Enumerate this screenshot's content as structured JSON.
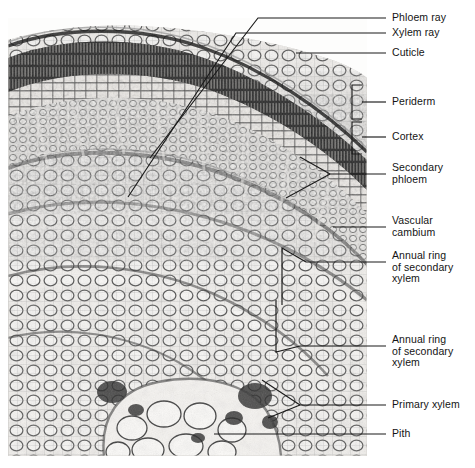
{
  "figure": {
    "kind": "light-micrograph",
    "colors": {
      "background": "#ffffff",
      "leader_line": "#1a1a1a",
      "label_text": "#141414",
      "tissue_light": "#f2f0ee",
      "tissue_mid": "#8d8d8d",
      "tissue_dark": "#1c1c1c"
    }
  },
  "labels": [
    {
      "id": "phloem-ray",
      "text": "Phloem ray"
    },
    {
      "id": "xylem-ray",
      "text": "Xylem ray"
    },
    {
      "id": "cuticle",
      "text": "Cuticle"
    },
    {
      "id": "periderm",
      "text": "Periderm"
    },
    {
      "id": "cortex",
      "text": "Cortex"
    },
    {
      "id": "secondary-phloem",
      "text": "Secondary\nphloem"
    },
    {
      "id": "vascular-cambium",
      "text": "Vascular\ncambium"
    },
    {
      "id": "annual-ring-outer",
      "text": "Annual ring\nof secondary\nxylem"
    },
    {
      "id": "annual-ring-inner",
      "text": "Annual ring\nof secondary\nxylem"
    },
    {
      "id": "primary-xylem",
      "text": "Primary xylem"
    },
    {
      "id": "pith",
      "text": "Pith"
    }
  ]
}
